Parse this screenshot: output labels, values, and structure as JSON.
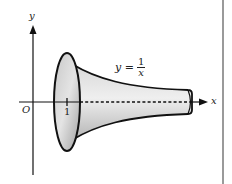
{
  "figure": {
    "axis_labels": {
      "x": "x",
      "y": "y",
      "origin": "O"
    },
    "tick_labels": {
      "x1": "1"
    },
    "curve_label": {
      "lhs": "y =",
      "numerator": "1",
      "denominator": "x"
    },
    "colors": {
      "outline": "#111111",
      "fill_light": "#e6e6e6",
      "fill_dark": "#a8a8a8",
      "axis": "#111111",
      "page_rule": "#9a9a9a"
    }
  }
}
